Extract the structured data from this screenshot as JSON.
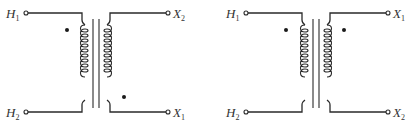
{
  "figure": {
    "diagrams": [
      {
        "name": "transformer-subtractive",
        "terminals": {
          "top_left": {
            "letter": "H",
            "sub": "1"
          },
          "bottom_left": {
            "letter": "H",
            "sub": "2"
          },
          "top_right": {
            "letter": "X",
            "sub": "2"
          },
          "bottom_right": {
            "letter": "X",
            "sub": "1"
          }
        },
        "polarity_dots": [
          "primary-top",
          "secondary-bottom"
        ]
      },
      {
        "name": "transformer-additive",
        "terminals": {
          "top_left": {
            "letter": "H",
            "sub": "1"
          },
          "bottom_left": {
            "letter": "H",
            "sub": "2"
          },
          "top_right": {
            "letter": "X",
            "sub": "1"
          },
          "bottom_right": {
            "letter": "X",
            "sub": "2"
          }
        },
        "polarity_dots": [
          "primary-top",
          "secondary-top"
        ]
      }
    ],
    "colors": {
      "line": "#2a2a2a",
      "text": "#333333",
      "background": "#ffffff"
    }
  }
}
